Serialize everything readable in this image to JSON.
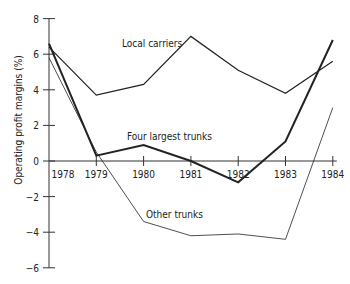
{
  "chart_data": {
    "type": "line",
    "title": "",
    "xlabel": "",
    "ylabel": "Operating profit margins (%)",
    "x": [
      "1978",
      "1979",
      "1980",
      "1981",
      "1982",
      "1983",
      "1984"
    ],
    "ylim": [
      -6,
      8
    ],
    "yticks": [
      -6,
      -4,
      -2,
      0,
      2,
      4,
      6,
      8
    ],
    "grid": false,
    "legend": "inline labels",
    "series": [
      {
        "name": "Local carriers",
        "values": [
          6.4,
          3.7,
          4.3,
          7.0,
          5.1,
          3.8,
          5.6
        ],
        "stroke_width": 1.2,
        "label_pos": {
          "x": 122,
          "y": 47
        }
      },
      {
        "name": "Four largest trunks",
        "values": [
          6.6,
          0.3,
          0.9,
          0.0,
          -1.2,
          1.1,
          6.8
        ],
        "stroke_width": 2,
        "label_pos": {
          "x": 127,
          "y": 140
        }
      },
      {
        "name": "Other trunks",
        "values": [
          5.8,
          0.5,
          -3.4,
          -4.2,
          -4.1,
          -4.4,
          3.0
        ],
        "stroke_width": 0.8,
        "label_pos": {
          "x": 146,
          "y": 218
        }
      }
    ]
  }
}
